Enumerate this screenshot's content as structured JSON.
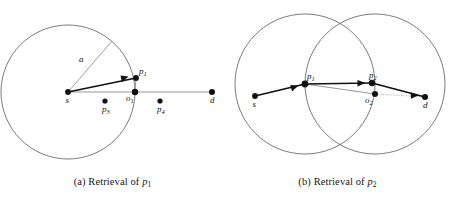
{
  "figure": {
    "background_color": "#ffffff",
    "node_color": "#111111",
    "circle_color": "#5a5a5a",
    "thin_edge_color": "#8c8c8c",
    "bold_edge_color": "#111111"
  },
  "panel_a": {
    "caption_prefix": "(a) Retrieval of ",
    "caption_symbol": "p",
    "caption_subscript": "1",
    "radius_label": "a",
    "nodes": [
      {
        "id": "s",
        "label": "s",
        "sub": "",
        "cx": 68,
        "cy": 92,
        "r": 2.9,
        "label_dx": -2.5,
        "label_dy": 11
      },
      {
        "id": "p1",
        "label": "p",
        "sub": "1",
        "cx": 136,
        "cy": 78,
        "r": 2.9,
        "label_dx": 3,
        "label_dy": -4
      },
      {
        "id": "o1",
        "label": "o",
        "sub": "1",
        "cx": 135,
        "cy": 92,
        "r": 3.2,
        "label_dx": -9,
        "label_dy": 9
      },
      {
        "id": "p3",
        "label": "p",
        "sub": "3",
        "cx": 105,
        "cy": 101,
        "r": 2.6,
        "label_dx": -3,
        "label_dy": 11
      },
      {
        "id": "p4",
        "label": "p",
        "sub": "4",
        "cx": 160,
        "cy": 101,
        "r": 2.6,
        "label_dx": -3,
        "label_dy": 11
      },
      {
        "id": "d",
        "label": "d",
        "sub": "",
        "cx": 212,
        "cy": 92,
        "r": 3.0,
        "label_dx": -2,
        "label_dy": 11
      }
    ],
    "circle": {
      "cx": 68,
      "cy": 92,
      "r": 67
    },
    "radius_line": {
      "x1": 68,
      "y1": 92,
      "x2": 112,
      "y2": 41,
      "label_x": 79,
      "label_y": 62
    },
    "thin_edges": [
      {
        "from": "s",
        "to": "d"
      },
      {
        "from": "p1",
        "to": "o1"
      }
    ],
    "bold_edges": [
      {
        "from": "s",
        "to": "p1"
      }
    ]
  },
  "panel_b": {
    "caption_prefix": "(b) Retrieval of ",
    "caption_symbol": "p",
    "caption_subscript": "2",
    "nodes": [
      {
        "id": "s",
        "label": "s",
        "sub": "",
        "cx": 30,
        "cy": 96,
        "r": 2.9,
        "label_dx": -2.5,
        "label_dy": 11
      },
      {
        "id": "p1",
        "label": "p",
        "sub": "1",
        "cx": 80,
        "cy": 84,
        "r": 3.4,
        "label_dx": 2,
        "label_dy": -5
      },
      {
        "id": "p2",
        "label": "p",
        "sub": "2",
        "cx": 147,
        "cy": 83,
        "r": 3.2,
        "label_dx": 0,
        "label_dy": -5
      },
      {
        "id": "o2",
        "label": "o",
        "sub": "2",
        "cx": 150,
        "cy": 94,
        "r": 3.0,
        "label_dx": -10,
        "label_dy": 9
      },
      {
        "id": "d",
        "label": "d",
        "sub": "",
        "cx": 200,
        "cy": 97,
        "r": 3.0,
        "label_dx": -2,
        "label_dy": 11
      }
    ],
    "circles": [
      {
        "cx": 80,
        "cy": 84,
        "r": 70
      },
      {
        "cx": 150,
        "cy": 84,
        "r": 70
      }
    ],
    "thin_edges": [
      {
        "from": "p1",
        "to": "o2"
      },
      {
        "from": "p1",
        "to": "p2"
      }
    ],
    "dotted_edges": [
      {
        "from": "o2",
        "to": "d"
      }
    ],
    "bold_edges": [
      {
        "from": "s",
        "to": "p1"
      },
      {
        "from": "p1",
        "to": "p2"
      },
      {
        "from": "p2",
        "to": "d"
      }
    ]
  }
}
